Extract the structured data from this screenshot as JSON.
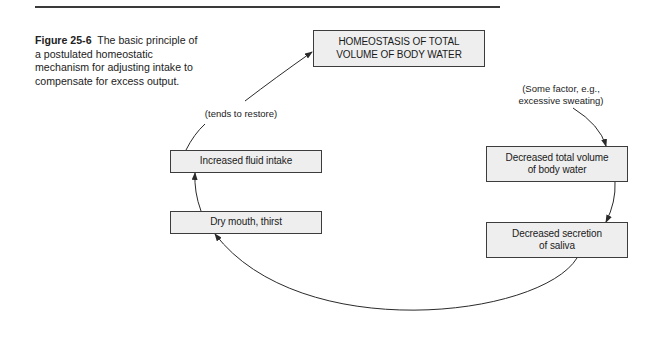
{
  "figure": {
    "number_label": "Figure 25-6",
    "caption_text": "The basic principle of a postulated homeostatic mechanism for adjusting intake to compensate for excess output."
  },
  "nodes": {
    "top": {
      "line1": "HOMEOSTASIS OF TOTAL",
      "line2": "VOLUME OF BODY WATER"
    },
    "decreased_volume": {
      "line1": "Decreased total volume",
      "line2": "of body water"
    },
    "decreased_saliva": {
      "line1": "Decreased secretion",
      "line2": "of saliva"
    },
    "dry_mouth": {
      "line1": "Dry mouth, thirst"
    },
    "increased_intake": {
      "line1": "Increased fluid intake"
    }
  },
  "annotations": {
    "restore": "(tends to restore)",
    "factor_line1": "(Some factor, e.g.,",
    "factor_line2": "excessive sweating)"
  },
  "edges": [
    {
      "from": "factor",
      "to": "decreased_volume"
    },
    {
      "from": "decreased_volume",
      "to": "decreased_saliva"
    },
    {
      "from": "decreased_saliva",
      "to": "dry_mouth"
    },
    {
      "from": "dry_mouth",
      "to": "increased_intake"
    },
    {
      "from": "increased_intake",
      "to": "top",
      "label": "(tends to restore)"
    }
  ],
  "colors": {
    "box_fill": "#eeeeee",
    "stroke": "#3c3c3c",
    "text": "#1a1a1a"
  }
}
